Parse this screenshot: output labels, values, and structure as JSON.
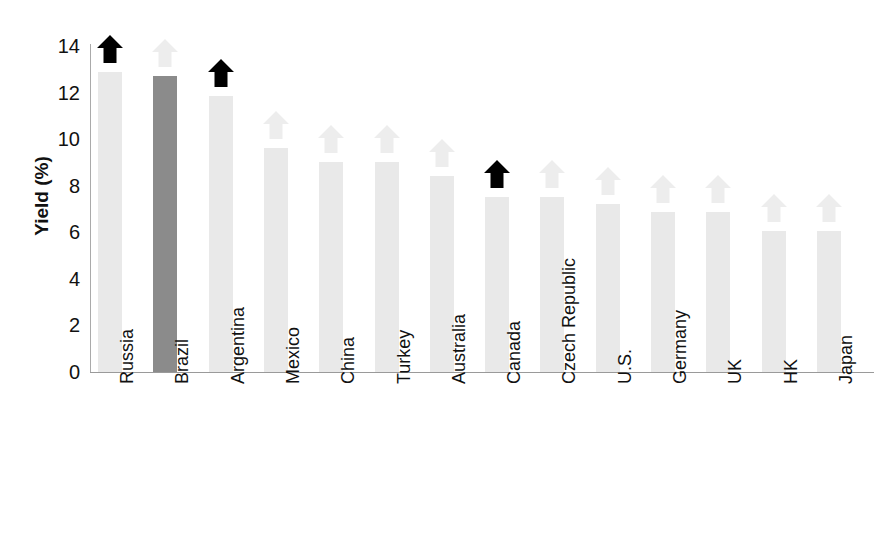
{
  "chart_data": {
    "type": "bar",
    "title": "",
    "xlabel": "",
    "ylabel": "Yield (%)",
    "ylim": [
      0,
      14
    ],
    "ytick_step": 2,
    "yticks": [
      "14",
      "12",
      "10",
      "8",
      "6",
      "4",
      "2",
      "0"
    ],
    "grid": false,
    "legend": "none",
    "categories": [
      "Russia",
      "Brazil",
      "Argentina",
      "Mexico",
      "China",
      "Turkey",
      "Australia",
      "Canada",
      "Czech Republic",
      "U.S.",
      "Germany",
      "UK",
      "HK",
      "Japan"
    ],
    "values": [
      12.9,
      12.7,
      11.85,
      9.6,
      9.0,
      9.0,
      8.4,
      7.5,
      7.5,
      7.2,
      6.85,
      6.85,
      6.05,
      6.05
    ],
    "highlighted_category": "Brazil",
    "annotations": {
      "arrow_marker": "up-arrow",
      "dark_arrow_categories": [
        "Russia",
        "Argentina",
        "Canada"
      ],
      "faint_arrow_categories": [
        "Brazil",
        "Mexico",
        "China",
        "Turkey",
        "Australia",
        "Czech Republic",
        "U.S.",
        "Germany",
        "UK",
        "HK",
        "Japan"
      ]
    },
    "colors": {
      "bar_light": "#e9e9e9",
      "bar_highlight": "#8b8b8b",
      "arrow_dark": "#000000",
      "arrow_faint": "#ededed",
      "axis": "#9a9a9a",
      "text": "#111111",
      "background": "#ffffff"
    }
  }
}
